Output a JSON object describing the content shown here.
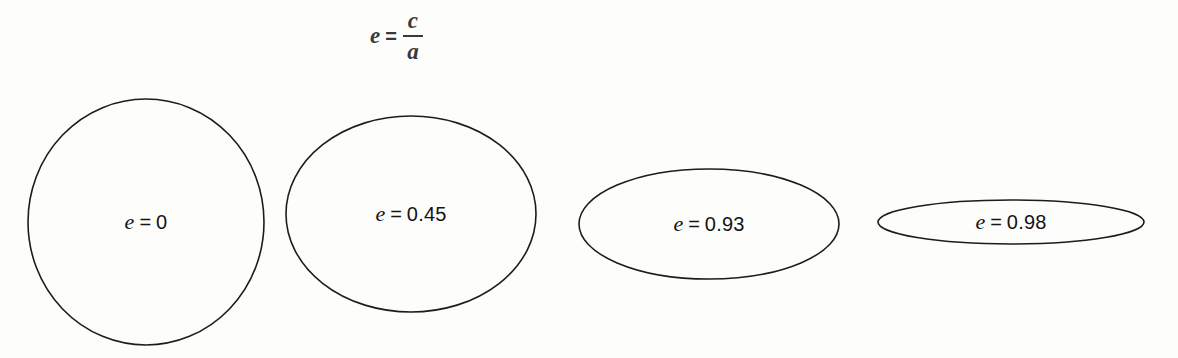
{
  "figure": {
    "background_color": "#fdfdfb",
    "outline_color": "#1c1c1c",
    "text_color": "#141414"
  },
  "formula": {
    "variable": "e",
    "equals": "=",
    "numerator": "c",
    "denominator": "a"
  },
  "chart_data": {
    "type": "diagram",
    "quantity_symbol": "e",
    "categories": [
      "e = 0",
      "e = 0.45",
      "e = 0.93",
      "e = 0.98"
    ],
    "values": [
      0,
      0.45,
      0.93,
      0.98
    ],
    "shapes": [
      {
        "label_variable": "e",
        "label_equals": "=",
        "label_value": "0",
        "eccentricity": 0,
        "x": 27,
        "y": 98,
        "width": 238,
        "height": 248
      },
      {
        "label_variable": "e",
        "label_equals": "=",
        "label_value": "0.45",
        "eccentricity": 0.45,
        "x": 285,
        "y": 115,
        "width": 252,
        "height": 198
      },
      {
        "label_variable": "e",
        "label_equals": "=",
        "label_value": "0.93",
        "eccentricity": 0.93,
        "x": 578,
        "y": 168,
        "width": 262,
        "height": 112
      },
      {
        "label_variable": "e",
        "label_equals": "=",
        "label_value": "0.98",
        "eccentricity": 0.98,
        "x": 877,
        "y": 199,
        "width": 268,
        "height": 46
      }
    ]
  }
}
